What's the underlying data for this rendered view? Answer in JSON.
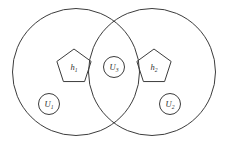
{
  "figure": {
    "background_color": "#ffffff",
    "stroke_color": "#3c3c3c",
    "label_color": "#2f2f2f"
  },
  "sets": [
    {
      "name": "left-set",
      "cx": 76,
      "cy": 72,
      "r": 63.5
    },
    {
      "name": "right-set",
      "cx": 152,
      "cy": 72,
      "r": 63.5
    }
  ],
  "pentagons": [
    {
      "name": "pentagon-h1",
      "cx": 74,
      "cy": 67,
      "r": 18,
      "label_base": "h",
      "label_sub": "1"
    },
    {
      "name": "pentagon-h2",
      "cx": 154,
      "cy": 67,
      "r": 18,
      "label_base": "h",
      "label_sub": "2"
    }
  ],
  "nodes": [
    {
      "name": "node-u3",
      "cx": 114,
      "cy": 67,
      "r": 10.5,
      "label_base": "U",
      "label_sub": "3"
    },
    {
      "name": "node-u1",
      "cx": 49,
      "cy": 104,
      "r": 10.5,
      "label_base": "U",
      "label_sub": "1"
    },
    {
      "name": "node-u2",
      "cx": 170,
      "cy": 104,
      "r": 10.5,
      "label_base": "U",
      "label_sub": "2"
    }
  ]
}
